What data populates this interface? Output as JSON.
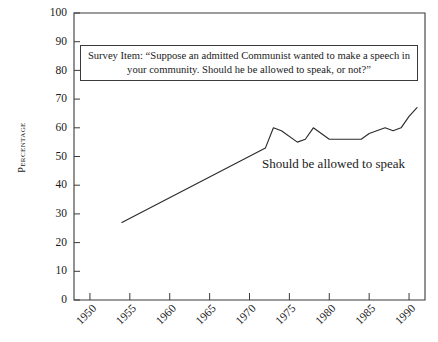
{
  "chart_data": {
    "type": "line",
    "title": "",
    "xlabel": "",
    "ylabel": "Percentage",
    "xlim": [
      1948,
      1992
    ],
    "ylim": [
      0,
      100
    ],
    "grid": false,
    "legend_position": "inline-annotation",
    "annotations": [
      {
        "text": "Should be allowed to speak",
        "x": 1975,
        "y": 48
      }
    ],
    "survey_item": {
      "line1": "Survey Item: “Suppose an admitted Communist wanted to make a speech in",
      "line2": "your community. Should he be allowed to speak, or not?”"
    },
    "yticks": [
      0,
      10,
      20,
      30,
      40,
      50,
      60,
      70,
      80,
      90,
      100
    ],
    "xticks": [
      1950,
      1955,
      1960,
      1965,
      1970,
      1975,
      1980,
      1985,
      1990
    ],
    "series": [
      {
        "name": "Should be allowed to speak",
        "x": [
          1954,
          1972,
          1973,
          1974,
          1976,
          1977,
          1978,
          1980,
          1982,
          1984,
          1985,
          1987,
          1988,
          1989,
          1990,
          1991
        ],
        "values": [
          27,
          53,
          60,
          59,
          55,
          56,
          60,
          56,
          56,
          56,
          58,
          60,
          59,
          60,
          64,
          67
        ]
      }
    ]
  },
  "axes": {
    "y_title": "Percentage"
  }
}
